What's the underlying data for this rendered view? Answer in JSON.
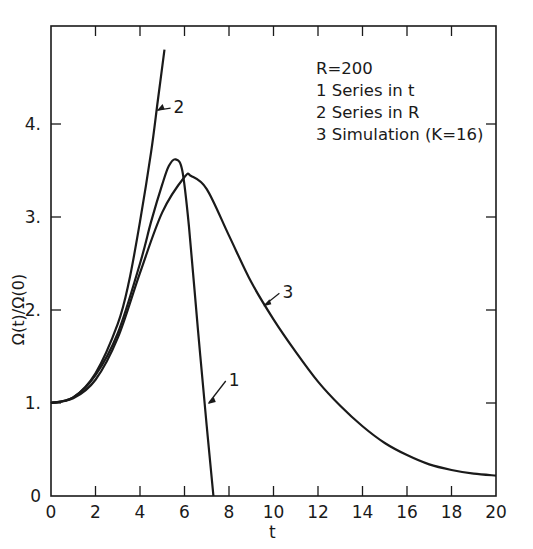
{
  "chart_data": {
    "type": "line",
    "title": "",
    "xlabel": "t",
    "ylabel": "Ω(t)/Ω(0)",
    "xlim": [
      0,
      20
    ],
    "ylim": [
      0,
      5
    ],
    "x_ticks": [
      "0",
      "2",
      "4",
      "6",
      "8",
      "10",
      "12",
      "14",
      "16",
      "18",
      "20"
    ],
    "y_ticks": [
      "0",
      "1.",
      "2.",
      "3.",
      "4."
    ],
    "grid": false,
    "legend": {
      "position": "upper right",
      "header": "R=200",
      "entries": [
        "1  Series in t",
        "2  Series in R",
        "3  Simulation (K=16)"
      ]
    },
    "series": [
      {
        "name": "1 Series in t",
        "label": "1",
        "x": [
          0,
          1,
          2,
          3,
          4,
          4.5,
          5,
          5.3,
          5.6,
          5.9,
          6.2,
          6.6,
          7.0,
          7.3
        ],
        "y": [
          1.0,
          1.06,
          1.3,
          1.75,
          2.5,
          2.95,
          3.35,
          3.55,
          3.62,
          3.5,
          2.9,
          1.8,
          0.75,
          0.0
        ]
      },
      {
        "name": "2 Series in R",
        "label": "2",
        "x": [
          0,
          1,
          2,
          3,
          3.5,
          4,
          4.5,
          4.8,
          5.1
        ],
        "y": [
          1.0,
          1.06,
          1.32,
          1.85,
          2.3,
          2.95,
          3.7,
          4.25,
          4.8
        ]
      },
      {
        "name": "3 Simulation (K=16)",
        "label": "3",
        "x": [
          0,
          1,
          2,
          3,
          4,
          5,
          6,
          6.3,
          7,
          8,
          9,
          10,
          11,
          12,
          13,
          14,
          15,
          16,
          17,
          18,
          19,
          20
        ],
        "y": [
          1.0,
          1.05,
          1.25,
          1.7,
          2.4,
          3.05,
          3.43,
          3.44,
          3.3,
          2.8,
          2.3,
          1.9,
          1.55,
          1.23,
          0.97,
          0.75,
          0.57,
          0.44,
          0.34,
          0.28,
          0.24,
          0.22
        ]
      }
    ],
    "annotations": [
      {
        "text": "1",
        "arrow_to": [
          7.0,
          1.0
        ]
      },
      {
        "text": "2",
        "arrow_to": [
          4.7,
          4.15
        ]
      },
      {
        "text": "3",
        "arrow_to": [
          9.5,
          2.05
        ]
      }
    ]
  },
  "labels": {
    "legend_header": "R=200",
    "legend_1": "1  Series in t",
    "legend_2": "2  Series in R",
    "legend_3": "3  Simulation (K=16)",
    "xlabel": "t",
    "ylabel": "Ω(t)/Ω(0)",
    "ann_1": "1",
    "ann_2": "2",
    "ann_3": "3"
  }
}
